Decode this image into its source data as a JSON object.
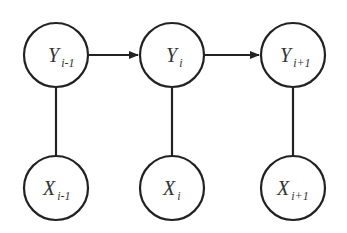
{
  "diagram": {
    "type": "graphical-model",
    "nodes": [
      {
        "id": "y_prev",
        "var": "Y",
        "sub": "i-1",
        "row": "hidden"
      },
      {
        "id": "y_cur",
        "var": "Y",
        "sub": "i",
        "row": "hidden"
      },
      {
        "id": "y_next",
        "var": "Y",
        "sub": "i+1",
        "row": "hidden"
      },
      {
        "id": "x_prev",
        "var": "X",
        "sub": "i-1",
        "row": "observed"
      },
      {
        "id": "x_cur",
        "var": "X",
        "sub": "i",
        "row": "observed"
      },
      {
        "id": "x_next",
        "var": "X",
        "sub": "i+1",
        "row": "observed"
      }
    ],
    "edges": [
      {
        "from": "y_prev",
        "to": "y_cur",
        "directed": true
      },
      {
        "from": "y_cur",
        "to": "y_next",
        "directed": true
      },
      {
        "from": "y_prev",
        "to": "x_prev",
        "directed": false
      },
      {
        "from": "y_cur",
        "to": "x_cur",
        "directed": false
      },
      {
        "from": "y_next",
        "to": "x_next",
        "directed": false
      }
    ],
    "colors": {
      "stroke": "#222222",
      "text": "#333333",
      "background": "#ffffff"
    }
  }
}
